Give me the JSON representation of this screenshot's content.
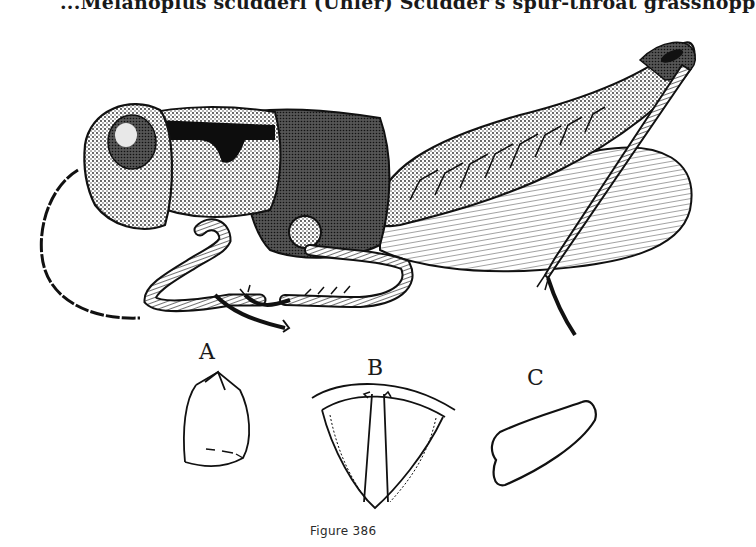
{
  "page": {
    "running_head": "...Melanoplus scudderi (Uhler) Scudder's spur-throat grasshopp",
    "figure": {
      "caption": "Figure 386",
      "main_illustration": "grasshopper-lateral-view",
      "details": [
        {
          "label": "A",
          "subject": "pronotum-outline"
        },
        {
          "label": "B",
          "subject": "prosternal-spur-outline"
        },
        {
          "label": "C",
          "subject": "cercus-outline"
        }
      ]
    }
  }
}
